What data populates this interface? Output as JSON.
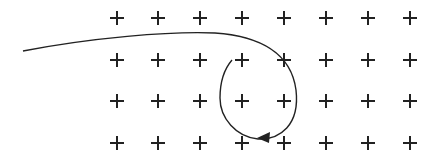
{
  "diagram": {
    "grid": {
      "rows": 4,
      "cols": 8,
      "x": [
        117,
        158,
        200,
        242,
        284,
        326,
        368,
        410
      ],
      "y": [
        18,
        60,
        101,
        143
      ],
      "symbol": "+",
      "color": "#222222"
    },
    "trajectory": {
      "color": "#222222",
      "path": "M23,51 C90,38 170,31 215,33 C258,36 291,52 296,90 C300,125 280,140 258,139 C236,137 220,118 220,98 C220,80 226,67 232,60",
      "arrow": {
        "x": 266,
        "y": 138,
        "direction": "left"
      }
    }
  }
}
